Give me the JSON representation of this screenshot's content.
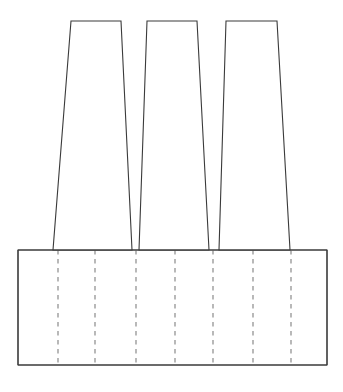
{
  "figure": {
    "canvas": {
      "width": 343,
      "height": 392
    },
    "background_color": "#ffffff",
    "solid_line_color": "#3a3a3a",
    "hidden_line_color": "#8a8a8a",
    "solid_line_width": 1.1,
    "hidden_line_width": 1.2,
    "hidden_line_dash": "4.5 4.5"
  },
  "base": {
    "label": "base-plate",
    "x_left": 18,
    "x_right": 327,
    "y_top": 250,
    "y_bottom": 365,
    "width": 309,
    "height": 115,
    "outline_points": "18,250 327,250 327,365 18,365"
  },
  "blades": [
    {
      "label": "blade-1",
      "top_y": 21,
      "bottom_y": 250,
      "top_left_x": 71,
      "top_right_x": 121,
      "bottom_left_x": 53,
      "bottom_right_x": 132,
      "top_width": 50,
      "bottom_width": 79,
      "height": 229,
      "outline_points": "71,21 121,21 132,250 53,250"
    },
    {
      "label": "blade-2",
      "top_y": 21,
      "bottom_y": 250,
      "top_left_x": 147,
      "top_right_x": 197,
      "bottom_left_x": 139,
      "bottom_right_x": 209,
      "top_width": 50,
      "bottom_width": 70,
      "height": 229,
      "outline_points": "147,21 197,21 209,250 139,250"
    },
    {
      "label": "blade-3",
      "top_y": 21,
      "bottom_y": 250,
      "top_left_x": 226,
      "top_right_x": 277,
      "bottom_left_x": 219,
      "bottom_right_x": 290,
      "top_width": 51,
      "bottom_width": 71,
      "height": 229,
      "outline_points": "226,21 277,21 290,250 219,250"
    }
  ],
  "hidden_lines": {
    "label": "hidden-edge-set",
    "count": 7,
    "y_top": 250,
    "y_bottom": 365,
    "x_positions": [
      58,
      95,
      136,
      175,
      213,
      253,
      291
    ]
  }
}
